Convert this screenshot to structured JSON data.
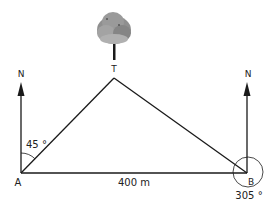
{
  "diagram": {
    "type": "bearings-triangle",
    "points": {
      "A": {
        "label": "A",
        "x": 21,
        "y": 173
      },
      "B": {
        "label": "B",
        "x": 247,
        "y": 173
      },
      "T": {
        "label": "T",
        "x": 114,
        "y": 78
      }
    },
    "north_labels": {
      "at_A": "N",
      "at_B": "N"
    },
    "angles": {
      "at_A": "45 °",
      "at_B": "305 °"
    },
    "distance_AB": "400 m",
    "landmark": {
      "name": "tree-icon",
      "label": "T"
    },
    "colors": {
      "line": "#1a1a1a",
      "tree_canopy": "#8c8c8c",
      "tree_trunk": "#1a1a1a"
    }
  }
}
